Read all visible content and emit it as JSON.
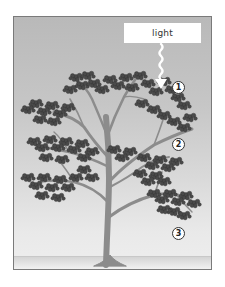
{
  "diagram": {
    "light_label": "light",
    "markers": [
      {
        "label": "1"
      },
      {
        "label": "2"
      },
      {
        "label": "3"
      }
    ],
    "colors": {
      "bg_top": "#b9b9b9",
      "bg_bottom": "#eeeeee",
      "frame_border": "#7a7a7a",
      "trunk": "#8c8c8c",
      "foliage": "#4a4a4a",
      "foliage_dark": "#333333",
      "arrow": "#ffffff"
    }
  }
}
